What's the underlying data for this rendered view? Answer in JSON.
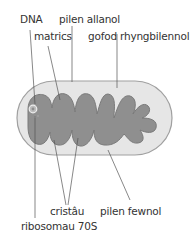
{
  "diagram": {
    "title": "",
    "labels": {
      "dna": "DNA",
      "outer_membrane": "pilen allanol",
      "matrix": "matrics",
      "intermembrane_space": "gofod rhyngbilennol",
      "cristae": "cristâu",
      "inner_membrane": "pilen fewnol",
      "ribosomes": "ribosomau 70S"
    },
    "colors": {
      "outer_membrane_fill": "#e6e6e6",
      "outer_membrane_stroke": "#9a9a9a",
      "inner_fill": "#8f8f8f",
      "inner_stroke": "#777777",
      "leader_lines": "#555555",
      "text": "#333333"
    }
  }
}
